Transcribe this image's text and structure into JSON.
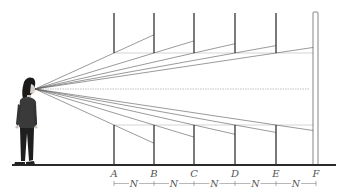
{
  "diagram": {
    "eye": {
      "x": 35,
      "y": 89
    },
    "horizon_y": 89,
    "ground_y": 165,
    "pole_top_y": 13,
    "upper_end_y": 53,
    "lower_start_y": 125,
    "poles": [
      {
        "label": "A",
        "x": 114
      },
      {
        "label": "B",
        "x": 154
      },
      {
        "label": "C",
        "x": 194
      },
      {
        "label": "D",
        "x": 235
      },
      {
        "label": "E",
        "x": 276
      },
      {
        "label": "F",
        "x": 316
      }
    ],
    "spacing_label": "N",
    "spacing_count": 5,
    "colors": {
      "pole": "#333333",
      "sight_line": "#555555",
      "guide_line": "#bbbbbb",
      "ground": "#2a2a2a",
      "label": "#555555",
      "figure_shirt": "#3a3a3a",
      "figure_pants": "#1e1e1e",
      "figure_hair": "#1a1a1a"
    }
  }
}
